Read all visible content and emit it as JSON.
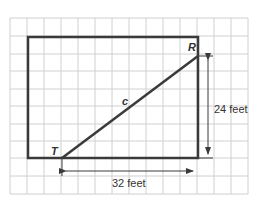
{
  "diagram": {
    "vertex_labels": {
      "top_right": "R",
      "bottom_left": "T"
    },
    "hypotenuse_label": "c",
    "vertical_dimension": "24 feet",
    "horizontal_dimension": "32 feet",
    "colors": {
      "grid": "#cfcfcf",
      "shape": "#3a3a3a",
      "text": "#333333",
      "background": "#ffffff"
    }
  }
}
